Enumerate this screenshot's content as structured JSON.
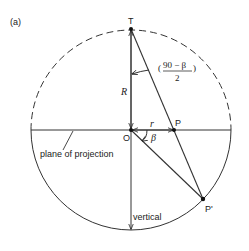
{
  "figure": {
    "panel_label": "(a)",
    "points": {
      "T": "T",
      "O": "O",
      "P": "P",
      "P_prime": "P'"
    },
    "labels": {
      "radius": "R",
      "r": "r",
      "beta": "β",
      "angle_numerator": "90 − β",
      "angle_denominator": "2",
      "plane": "plane of projection",
      "vertical": "vertical"
    },
    "geometry": {
      "center": [
        131,
        130
      ],
      "radius": 100,
      "upper_half_style": "dashed",
      "lower_half_style": "solid"
    }
  }
}
